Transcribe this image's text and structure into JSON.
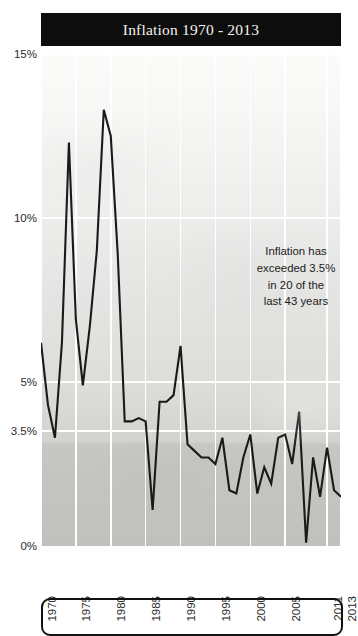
{
  "title": "Inflation 1970 - 2013",
  "annotation": "Inflation has\nexceeded 3.5%\nin 20 of the\nlast 43 years",
  "colors": {
    "title_bar_background": "#0d0d0d",
    "title_text": "#f4f2ee",
    "series_line": "#1a1a1a",
    "gridline": "#ffffff",
    "plot_background_top": "#fbfbfa",
    "plot_background_bottom": "#c0c0bd",
    "axis_text": "#2b2b2b",
    "bottom_box_border": "#111111"
  },
  "chart_data": {
    "type": "line",
    "title": "Inflation 1970 - 2013",
    "xlabel": "",
    "ylabel": "",
    "ylim": [
      0,
      15
    ],
    "xlim": [
      1970,
      2013
    ],
    "grid": true,
    "legend": false,
    "ytick_labels": [
      "15%",
      "10%",
      "5%",
      "3.5%",
      "0%"
    ],
    "ytick_values": [
      15,
      10,
      5,
      3.5,
      0
    ],
    "xtick_labels": [
      "1970",
      "1975",
      "1980",
      "1985",
      "1990",
      "1995",
      "2000",
      "2005",
      "2011",
      "2013"
    ],
    "xtick_values": [
      1970,
      1975,
      1980,
      1985,
      1990,
      1995,
      2000,
      2005,
      2011,
      2013
    ],
    "threshold": 3.5,
    "threshold_label": "3.5%",
    "annotation": "Inflation has exceeded 3.5% in 20 of the last 43 years",
    "series": [
      {
        "name": "Inflation",
        "x": [
          1970,
          1971,
          1972,
          1973,
          1974,
          1975,
          1976,
          1977,
          1978,
          1979,
          1980,
          1981,
          1982,
          1983,
          1984,
          1985,
          1986,
          1987,
          1988,
          1989,
          1990,
          1991,
          1992,
          1993,
          1994,
          1995,
          1996,
          1997,
          1998,
          1999,
          2000,
          2001,
          2002,
          2003,
          2004,
          2005,
          2006,
          2007,
          2008,
          2009,
          2010,
          2011,
          2012,
          2013
        ],
        "values": [
          6.2,
          4.3,
          3.3,
          6.2,
          12.3,
          6.9,
          4.9,
          6.7,
          9.0,
          13.3,
          12.5,
          8.9,
          3.8,
          3.8,
          3.9,
          3.8,
          1.1,
          4.4,
          4.4,
          4.6,
          6.1,
          3.1,
          2.9,
          2.7,
          2.7,
          2.5,
          3.3,
          1.7,
          1.6,
          2.7,
          3.4,
          1.6,
          2.4,
          1.9,
          3.3,
          3.4,
          2.5,
          4.1,
          0.1,
          2.7,
          1.5,
          3.0,
          1.7,
          1.5
        ]
      }
    ]
  }
}
